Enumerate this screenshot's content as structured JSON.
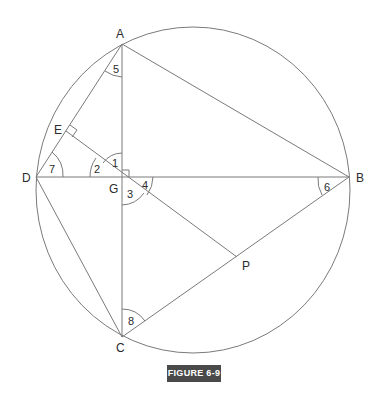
{
  "figure": {
    "caption": "FIGURE 6-9",
    "points": {
      "A": "A",
      "B": "B",
      "C": "C",
      "D": "D",
      "E": "E",
      "G": "G",
      "P": "P"
    },
    "angles": [
      "1",
      "2",
      "3",
      "4",
      "5",
      "6",
      "7",
      "8"
    ],
    "segments": [
      "AD",
      "AB",
      "AC",
      "DB",
      "DC",
      "CB",
      "EP"
    ],
    "right_angles": [
      "E",
      "G"
    ],
    "shapes": [
      "circle through A, B, C, D"
    ]
  },
  "colors": {
    "line": "#7a7a7a",
    "caption_bg": "#4a4a4a",
    "caption_text": "#ffffff"
  }
}
